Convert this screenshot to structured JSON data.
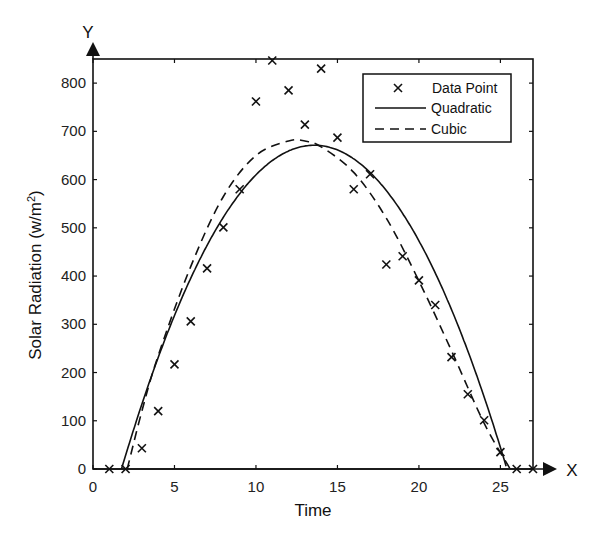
{
  "chart_data": {
    "type": "scatter",
    "title": "",
    "xlabel": "Time",
    "ylabel": "Solar Radiation (w/m²)",
    "ylabel_main": "Solar Radiation (w/m",
    "ylabel_sup": "2",
    "ylabel_close": ")",
    "x_axis_arrow_label": "X",
    "y_axis_arrow_label": "Y",
    "xlim": [
      0,
      27
    ],
    "ylim": [
      0,
      850
    ],
    "x_ticks": [
      0,
      5,
      10,
      15,
      20,
      25
    ],
    "y_ticks": [
      0,
      100,
      200,
      300,
      400,
      500,
      600,
      700,
      800
    ],
    "grid": false,
    "legend_position": "upper right",
    "legend": [
      "Data Point",
      "Quadratic",
      "Cubic"
    ],
    "series": [
      {
        "name": "Data Point",
        "style": "x-marker",
        "x": [
          1,
          2,
          3,
          4,
          5,
          6,
          7,
          8,
          9,
          10,
          11,
          12,
          13,
          14,
          15,
          16,
          17,
          18,
          19,
          20,
          21,
          22,
          23,
          24,
          25,
          26,
          27
        ],
        "y": [
          0,
          0,
          43,
          120,
          217,
          306,
          416,
          501,
          580,
          762,
          847,
          785,
          714,
          830,
          687,
          580,
          611,
          424,
          441,
          391,
          340,
          232,
          155,
          101,
          35,
          0,
          0
        ]
      },
      {
        "name": "Quadratic",
        "style": "solid",
        "x": [
          1.75,
          3,
          5,
          7,
          9,
          11,
          13,
          13.6,
          15,
          17,
          19,
          21,
          23,
          25,
          25.4
        ],
        "y": [
          0,
          142,
          353,
          500,
          571,
          598,
          628,
          671,
          655,
          589,
          507,
          426,
          277,
          48,
          0
        ]
      },
      {
        "name": "Cubic",
        "style": "dashed",
        "x": [
          2.1,
          3,
          4,
          6,
          8,
          10,
          12,
          13,
          14,
          16,
          18,
          20,
          22,
          24,
          25.6
        ],
        "y": [
          0,
          120,
          235,
          420,
          565,
          650,
          680,
          680,
          668,
          615,
          520,
          390,
          245,
          95,
          0
        ]
      }
    ]
  },
  "labels": {
    "xlabel": "Time",
    "ylabel_main": "Solar Radiation (w/m",
    "ylabel_sup": "2",
    "ylabel_close": ")",
    "x_arrow": "X",
    "y_arrow": "Y",
    "legend_data_point": "Data Point",
    "legend_quadratic": "Quadratic",
    "legend_cubic": "Cubic",
    "legend_marker": "×"
  },
  "quadratic_fit": {
    "a": -4.8,
    "root1": 1.75,
    "root2": 25.4
  },
  "colors": {
    "line": "#111111",
    "background": "#ffffff"
  }
}
